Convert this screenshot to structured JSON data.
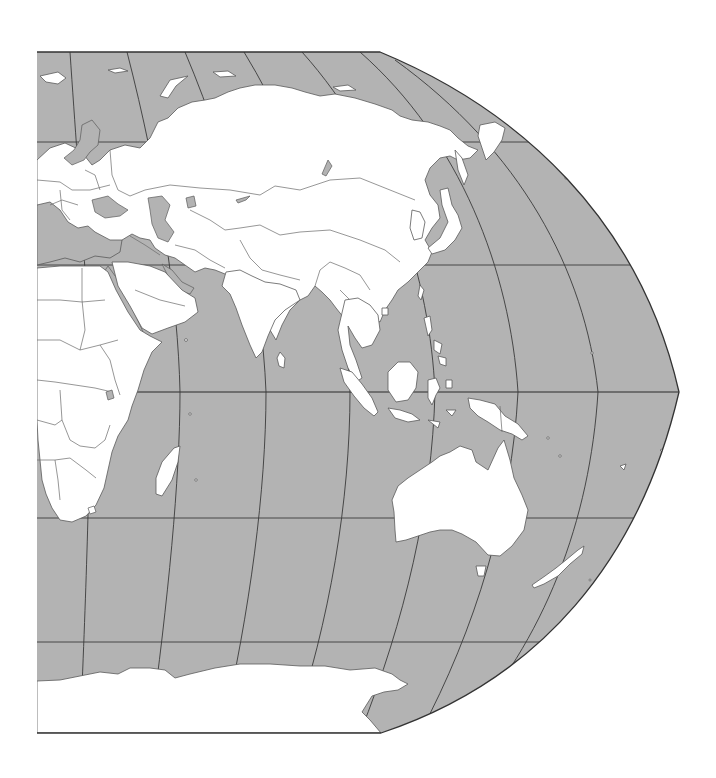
{
  "map": {
    "type": "world-map-projection",
    "view": "Eastern Hemisphere (Europe, Africa, Asia, Oceania, Antarctica)",
    "colors": {
      "ocean": "#b3b3b3",
      "land": "#ffffff",
      "outline": "#5a5a5a",
      "graticule": "#3a3a3a",
      "background": "#ffffff"
    },
    "bounds_px": {
      "left": 37,
      "top": 52,
      "bottom": 733,
      "right_max": 679
    },
    "graticule": {
      "parallels_y": [
        142,
        265,
        392,
        518,
        642
      ],
      "equator_y": 392,
      "meridians_count": 6
    },
    "regions": [
      "Europe",
      "Africa",
      "Middle East",
      "Russia",
      "Central Asia",
      "China",
      "India",
      "Southeast Asia",
      "Japan",
      "Indonesia",
      "Papua New Guinea",
      "Australia",
      "New Zealand",
      "Madagascar",
      "Antarctica"
    ]
  }
}
